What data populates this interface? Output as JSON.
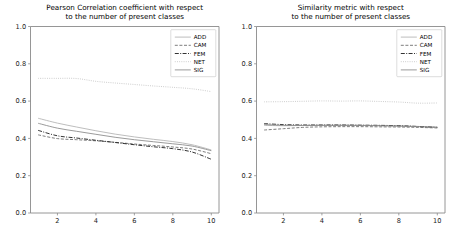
{
  "figure": {
    "width": 452,
    "height": 244,
    "background": "#ffffff",
    "panel_count": 2
  },
  "chart_data": [
    {
      "id": "pearson",
      "type": "line",
      "title": "Pearson Correlation coefficient with respect\nto the number of present classes",
      "title_line1": "Pearson Correlation coefficient with respect",
      "title_line2": "to the number of present classes",
      "xlabel": "",
      "ylabel": "",
      "xlim": [
        0.6,
        10.4
      ],
      "ylim": [
        0.0,
        1.0
      ],
      "xticks": [
        2,
        4,
        6,
        8,
        10
      ],
      "xticklabels": [
        "2",
        "4",
        "6",
        "8",
        "10"
      ],
      "yticks": [
        0.0,
        0.2,
        0.4,
        0.6,
        0.8,
        1.0
      ],
      "yticklabels": [
        "0.0",
        "0.2",
        "0.4",
        "0.6",
        "0.8",
        "1.0"
      ],
      "grid": false,
      "legend_position": "upper right",
      "x": [
        1,
        2,
        3,
        4,
        5,
        6,
        7,
        8,
        9,
        10
      ],
      "series": [
        {
          "name": "ADD",
          "color": "#b5b5b5",
          "dash": "none",
          "width": 0.9,
          "values": [
            0.508,
            0.482,
            0.461,
            0.441,
            0.423,
            0.408,
            0.395,
            0.383,
            0.366,
            0.338
          ]
        },
        {
          "name": "CAM",
          "color": "#6e6e6e",
          "dash": "dashed",
          "width": 0.9,
          "values": [
            0.419,
            0.399,
            0.393,
            0.387,
            0.379,
            0.37,
            0.362,
            0.354,
            0.343,
            0.318
          ]
        },
        {
          "name": "FEM",
          "color": "#1c1c1c",
          "dash": "dashdot",
          "width": 0.9,
          "values": [
            0.443,
            0.414,
            0.402,
            0.39,
            0.378,
            0.366,
            0.355,
            0.345,
            0.327,
            0.288
          ]
        },
        {
          "name": "NET",
          "color": "#c9c9c9",
          "dash": "dotted",
          "width": 1.0,
          "values": [
            0.722,
            0.722,
            0.721,
            0.706,
            0.697,
            0.689,
            0.681,
            0.674,
            0.666,
            0.651
          ]
        },
        {
          "name": "SIG",
          "color": "#8f8f8f",
          "dash": "none",
          "width": 0.9,
          "values": [
            0.481,
            0.455,
            0.438,
            0.422,
            0.406,
            0.393,
            0.382,
            0.371,
            0.359,
            0.334
          ]
        }
      ]
    },
    {
      "id": "similarity",
      "type": "line",
      "title": "Similarity metric with respect\nto the number of present classes",
      "title_line1": "Similarity metric with respect",
      "title_line2": "to the number of present classes",
      "xlabel": "",
      "ylabel": "",
      "xlim": [
        0.6,
        10.4
      ],
      "ylim": [
        0.0,
        1.0
      ],
      "xticks": [
        2,
        4,
        6,
        8,
        10
      ],
      "xticklabels": [
        "2",
        "4",
        "6",
        "8",
        "10"
      ],
      "yticks": [
        0.0,
        0.2,
        0.4,
        0.6,
        0.8,
        1.0
      ],
      "yticklabels": [
        "0.0",
        "0.2",
        "0.4",
        "0.6",
        "0.8",
        "1.0"
      ],
      "grid": false,
      "legend_position": "upper right",
      "x": [
        1,
        2,
        3,
        4,
        5,
        6,
        7,
        8,
        9,
        10
      ],
      "series": [
        {
          "name": "ADD",
          "color": "#b5b5b5",
          "dash": "none",
          "width": 0.9,
          "values": [
            0.47,
            0.468,
            0.469,
            0.47,
            0.47,
            0.469,
            0.468,
            0.467,
            0.464,
            0.461
          ]
        },
        {
          "name": "CAM",
          "color": "#6e6e6e",
          "dash": "dashed",
          "width": 0.9,
          "values": [
            0.445,
            0.452,
            0.459,
            0.462,
            0.463,
            0.463,
            0.462,
            0.461,
            0.459,
            0.456
          ]
        },
        {
          "name": "FEM",
          "color": "#1c1c1c",
          "dash": "dashdot",
          "width": 0.9,
          "values": [
            0.479,
            0.474,
            0.472,
            0.472,
            0.472,
            0.471,
            0.47,
            0.468,
            0.464,
            0.459
          ]
        },
        {
          "name": "NET",
          "color": "#c9c9c9",
          "dash": "dotted",
          "width": 1.0,
          "values": [
            0.596,
            0.597,
            0.599,
            0.601,
            0.6,
            0.601,
            0.598,
            0.595,
            0.589,
            0.59
          ]
        },
        {
          "name": "SIG",
          "color": "#8f8f8f",
          "dash": "none",
          "width": 0.9,
          "values": [
            0.474,
            0.47,
            0.469,
            0.47,
            0.47,
            0.47,
            0.468,
            0.466,
            0.463,
            0.459
          ]
        }
      ]
    }
  ]
}
